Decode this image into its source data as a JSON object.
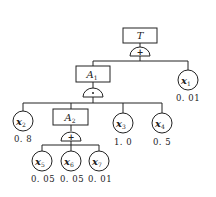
{
  "diagram": {
    "type": "fault-tree",
    "top_event": {
      "label": "T",
      "gate": "OR",
      "gate_symbol": "+"
    },
    "intermediate_events": [
      {
        "id": "A1",
        "label": "A",
        "subscript": "1",
        "gate": "AND",
        "gate_symbol": "·"
      },
      {
        "id": "A2",
        "label": "A",
        "subscript": "2",
        "gate": "OR",
        "gate_symbol": "+"
      }
    ],
    "basic_events": [
      {
        "id": "x1",
        "label": "x",
        "subscript": "1",
        "probability": "0. 01",
        "parent": "T"
      },
      {
        "id": "x2",
        "label": "x",
        "subscript": "2",
        "probability": "0. 8",
        "parent": "A1"
      },
      {
        "id": "x3",
        "label": "x",
        "subscript": "3",
        "probability": "1. 0",
        "parent": "A1"
      },
      {
        "id": "x4",
        "label": "x",
        "subscript": "4",
        "probability": "0. 5",
        "parent": "A1"
      },
      {
        "id": "x5",
        "label": "x",
        "subscript": "5",
        "probability": "0. 05",
        "parent": "A2"
      },
      {
        "id": "x6",
        "label": "x",
        "subscript": "6",
        "probability": "0. 05",
        "parent": "A2"
      },
      {
        "id": "x7",
        "label": "x",
        "subscript": "7",
        "probability": "0. 01",
        "parent": "A2"
      }
    ],
    "edges": [
      [
        "T",
        "A1"
      ],
      [
        "T",
        "x1"
      ],
      [
        "A1",
        "x2"
      ],
      [
        "A1",
        "A2"
      ],
      [
        "A1",
        "x3"
      ],
      [
        "A1",
        "x4"
      ],
      [
        "A2",
        "x5"
      ],
      [
        "A2",
        "x6"
      ],
      [
        "A2",
        "x7"
      ]
    ]
  }
}
